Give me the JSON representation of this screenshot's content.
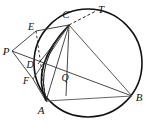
{
  "figure": {
    "kind": "euclidean-geometry-diagram",
    "width": 148,
    "height": 125,
    "background_color": "#ffffff",
    "stroke_color": "#1a1a1a",
    "circle_stroke_color": "#111111",
    "chord_stroke_color": "#555555",
    "labels": {
      "A": "A",
      "B": "B",
      "C": "C",
      "D": "D",
      "E": "E",
      "F": "F",
      "P": "P",
      "Q": "Q",
      "T": "T"
    },
    "points": {
      "A": {
        "x": 46,
        "y": 101
      },
      "B": {
        "x": 132,
        "y": 96
      },
      "C": {
        "x": 69,
        "y": 25
      },
      "D": {
        "x": 38,
        "y": 64
      },
      "E": {
        "x": 36,
        "y": 31
      },
      "F": {
        "x": 33,
        "y": 79
      },
      "P": {
        "x": 12,
        "y": 51
      },
      "Q": {
        "x": 67,
        "y": 73
      },
      "T": {
        "x": 96,
        "y": 11
      }
    },
    "label_offsets": {
      "A": {
        "x": 41,
        "y": 112
      },
      "B": {
        "x": 136,
        "y": 100
      },
      "C": {
        "x": 65,
        "y": 19
      },
      "D": {
        "x": 30,
        "y": 65
      },
      "E": {
        "x": 29,
        "y": 29
      },
      "F": {
        "x": 25,
        "y": 82
      },
      "P": {
        "x": 2,
        "y": 54
      },
      "Q": {
        "x": 63,
        "y": 80
      },
      "T": {
        "x": 98,
        "y": 11
      }
    },
    "circle": {
      "cx": 88,
      "cy": 63,
      "r": 54
    },
    "arc_AC": {
      "description": "bold arc bulging left from A up to C",
      "control_x": 34,
      "control_y": 62
    },
    "segments": [
      {
        "name": "segment-AB",
        "from": "A",
        "to": "B",
        "style": "solid",
        "weight": "thin"
      },
      {
        "name": "segment-AC",
        "from": "A",
        "to": "C",
        "style": "solid",
        "weight": "thin"
      },
      {
        "name": "segment-CB",
        "from": "C",
        "to": "B",
        "style": "solid",
        "weight": "thin"
      },
      {
        "name": "segment-PE",
        "from": "P",
        "to": "E",
        "style": "solid",
        "weight": "thin"
      },
      {
        "name": "segment-PD",
        "from": "P",
        "to": "D",
        "style": "solid",
        "weight": "thin"
      },
      {
        "name": "segment-PF",
        "from": "P",
        "to": "F",
        "style": "solid",
        "weight": "thin"
      },
      {
        "name": "segment-PB",
        "from": "P",
        "to": "B",
        "style": "solid",
        "weight": "thin"
      },
      {
        "name": "segment-EC",
        "from": "E",
        "to": "C",
        "style": "solid",
        "weight": "thin"
      },
      {
        "name": "segment-FA",
        "from": "F",
        "to": "A",
        "style": "solid",
        "weight": "thin"
      },
      {
        "name": "segment-CD",
        "from": "C",
        "to": "D",
        "style": "solid",
        "weight": "thin"
      },
      {
        "name": "segment-CQ-A",
        "from": "C",
        "to": "A",
        "style": "solid",
        "weight": "thin"
      },
      {
        "name": "segment-CF",
        "from": "C",
        "to": "F",
        "style": "solid",
        "weight": "thin"
      }
    ],
    "dashed_segments": [
      {
        "name": "tangent-CT",
        "from": "C",
        "to": "T",
        "style": "dashed"
      },
      {
        "name": "dashed-EA",
        "from": "E",
        "to": "A",
        "style": "dashed"
      }
    ],
    "notes": {
      "tangent": "CT is drawn dashed, tangent to the circle at C",
      "external_point": "P lies outside the circle to the left",
      "intersection_Q": "Q is the interior intersection point of the cevians"
    }
  }
}
